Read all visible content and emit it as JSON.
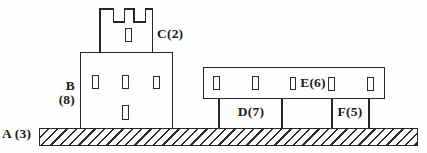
{
  "figure": {
    "kind": "labeled structure diagram (castle tower and beam on pillars over hatched ground)",
    "ink_color": "#262626",
    "background_color": "#fefefe"
  },
  "labels": {
    "ground": "A (3)",
    "building_letter": "B",
    "building_number": "(8)",
    "tower": "C(2)",
    "left_pillar": "D(7)",
    "beam": "E(6)",
    "right_pillar": "F(5)"
  },
  "components": [
    {
      "id": "A",
      "value": 3,
      "role": "hatched ground strip"
    },
    {
      "id": "B",
      "value": 8,
      "role": "main building with four windows"
    },
    {
      "id": "C",
      "value": 2,
      "role": "crenellated tower with one window"
    },
    {
      "id": "D",
      "value": 7,
      "role": "left support bay under beam"
    },
    {
      "id": "E",
      "value": 6,
      "role": "horizontal beam with five windows"
    },
    {
      "id": "F",
      "value": 5,
      "role": "right support bay under beam"
    }
  ]
}
